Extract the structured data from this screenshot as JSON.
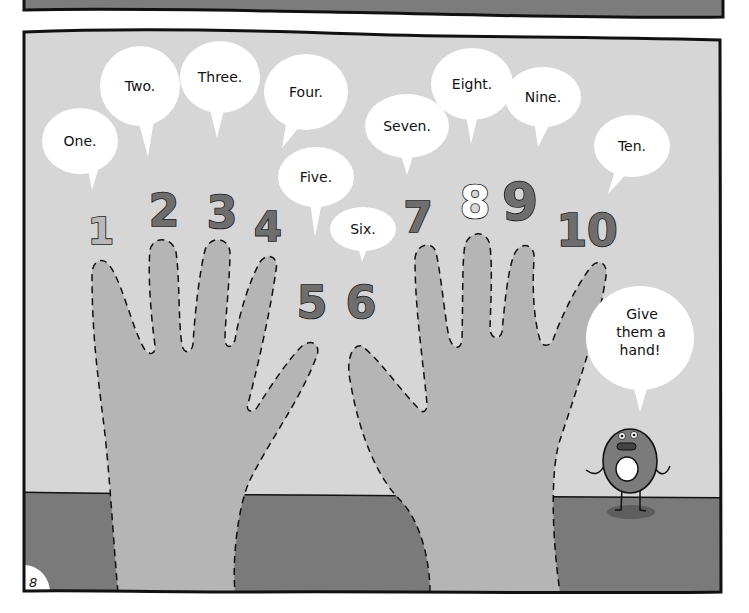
{
  "page": {
    "page_number": "8"
  },
  "colors": {
    "wall": "#d6d6d6",
    "floor": "#7a7a7a",
    "hand": "#b5b5b5",
    "top_panel_fill": "#7c7c7c",
    "outline": "#111111",
    "bubble": "#ffffff",
    "numeral_light": "#b8b8b8",
    "numeral_dark": "#6e6e6e",
    "numeral_outline_only": "#ffffff",
    "donut_body": "#7b7b7b",
    "donut_shadow": "#5e5e5e"
  },
  "numbers": [
    {
      "label": "1",
      "word": "One.",
      "style": "light"
    },
    {
      "label": "2",
      "word": "Two.",
      "style": "dark"
    },
    {
      "label": "3",
      "word": "Three.",
      "style": "dark"
    },
    {
      "label": "4",
      "word": "Four.",
      "style": "dark"
    },
    {
      "label": "5",
      "word": "Five.",
      "style": "dark"
    },
    {
      "label": "6",
      "word": "Six.",
      "style": "dark"
    },
    {
      "label": "7",
      "word": "Seven.",
      "style": "dark"
    },
    {
      "label": "8",
      "word": "Eight.",
      "style": "outline"
    },
    {
      "label": "9",
      "word": "Nine.",
      "style": "dark"
    },
    {
      "label": "10",
      "word": "Ten.",
      "style": "dark"
    }
  ],
  "character": {
    "name": "donut",
    "speech": [
      "Give",
      "them a",
      "hand!"
    ]
  }
}
